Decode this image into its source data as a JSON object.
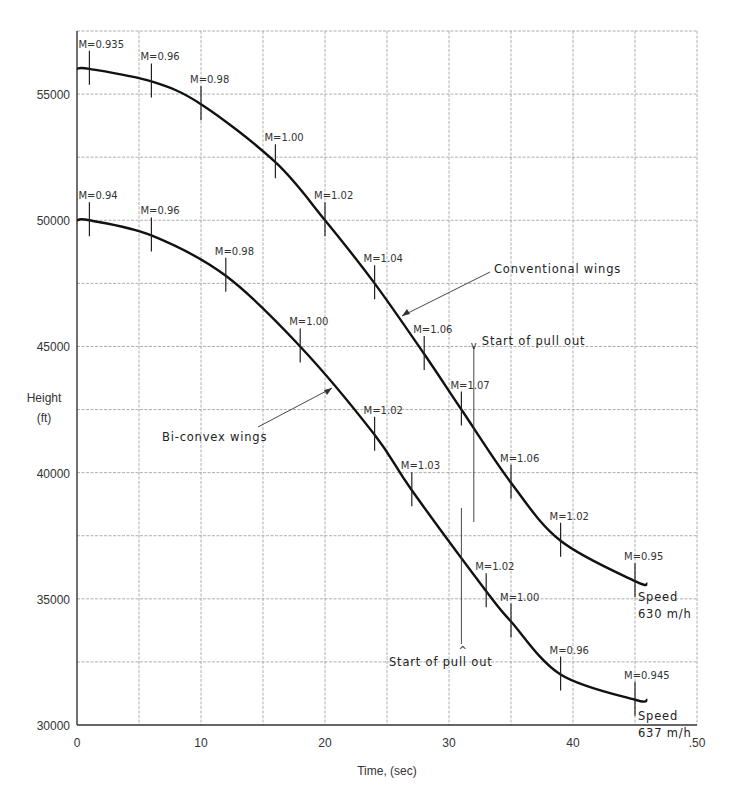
{
  "chart_data": {
    "type": "line",
    "title": "",
    "xlabel": "Time, (sec)",
    "ylabel": "Height (ft)",
    "ylabel_lines": [
      "Height",
      "(ft)"
    ],
    "xlim": [
      0,
      50
    ],
    "ylim": [
      30000,
      57500
    ],
    "x_ticks": [
      0,
      10,
      20,
      30,
      40,
      50
    ],
    "x_tick_labels": [
      "0",
      "10",
      "20",
      "30",
      "40",
      ".50"
    ],
    "y_ticks": [
      30000,
      35000,
      40000,
      45000,
      50000,
      55000
    ],
    "y_tick_labels": [
      "30000",
      "35000",
      "40000",
      "45000",
      "50000",
      "55000"
    ],
    "grid": true,
    "series": [
      {
        "name": "Conventional wings",
        "x": [
          0,
          1,
          6,
          10,
          16,
          20,
          24,
          28,
          31,
          35,
          39,
          45,
          46
        ],
        "y": [
          56000,
          56000,
          55500,
          54600,
          52300,
          50000,
          47500,
          44700,
          42500,
          39600,
          37300,
          35700,
          35600
        ],
        "mach_labels": [
          {
            "t": 1,
            "h": 56000,
            "label": "M=0.935"
          },
          {
            "t": 6,
            "h": 55500,
            "label": "M=0.96"
          },
          {
            "t": 10,
            "h": 54600,
            "label": "M=0.98"
          },
          {
            "t": 16,
            "h": 52300,
            "label": "M=1.00"
          },
          {
            "t": 20,
            "h": 50000,
            "label": "M=1.02"
          },
          {
            "t": 24,
            "h": 47500,
            "label": "M=1.04"
          },
          {
            "t": 28,
            "h": 44700,
            "label": "M=1.06"
          },
          {
            "t": 31,
            "h": 42500,
            "label": "M=1.07"
          },
          {
            "t": 35,
            "h": 39600,
            "label": "M=1.06"
          },
          {
            "t": 39,
            "h": 37300,
            "label": "M=1.02"
          },
          {
            "t": 45,
            "h": 35700,
            "label": "M=0.95"
          }
        ],
        "end_note": [
          "Speed",
          "630 m/h"
        ]
      },
      {
        "name": "Bi-convex wings",
        "x": [
          0,
          1,
          6,
          12,
          18,
          24,
          27,
          33,
          35,
          39,
          45,
          46
        ],
        "y": [
          50000,
          50000,
          49400,
          47800,
          45000,
          41500,
          39300,
          35300,
          34100,
          32000,
          31000,
          31000
        ],
        "mach_labels": [
          {
            "t": 1,
            "h": 50000,
            "label": "M=0.94"
          },
          {
            "t": 6,
            "h": 49400,
            "label": "M=0.96"
          },
          {
            "t": 12,
            "h": 47800,
            "label": "M=0.98"
          },
          {
            "t": 18,
            "h": 45000,
            "label": "M=1.00"
          },
          {
            "t": 24,
            "h": 41500,
            "label": "M=1.02"
          },
          {
            "t": 27,
            "h": 39300,
            "label": "M=1.03"
          },
          {
            "t": 33,
            "h": 35300,
            "label": "M=1.02"
          },
          {
            "t": 35,
            "h": 34100,
            "label": "M=1.00"
          },
          {
            "t": 39,
            "h": 32000,
            "label": "M=0.96"
          },
          {
            "t": 45,
            "h": 31000,
            "label": "M=0.945"
          }
        ],
        "end_note": [
          "Speed",
          "637 m/h"
        ]
      }
    ],
    "annotations": [
      {
        "text": "Conventional wings",
        "points_to": "Conventional wings"
      },
      {
        "text": "Bi-convex wings",
        "points_to": "Bi-convex wings"
      },
      {
        "text": "Start of pull out",
        "series": "Conventional wings",
        "t": 32
      },
      {
        "text": "Start of pull out",
        "series": "Bi-convex wings",
        "t": 31
      }
    ]
  }
}
